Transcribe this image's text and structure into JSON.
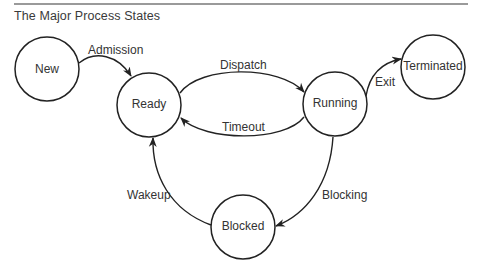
{
  "title": "The Major Process States",
  "colors": {
    "rule": "#9a9a9a",
    "stroke": "#222222",
    "text": "#333333"
  },
  "nodes": [
    {
      "id": "new",
      "label": "New",
      "cx": 47,
      "cy": 69,
      "r": 32
    },
    {
      "id": "ready",
      "label": "Ready",
      "cx": 149,
      "cy": 105,
      "r": 32
    },
    {
      "id": "running",
      "label": "Running",
      "cx": 335,
      "cy": 104,
      "r": 32
    },
    {
      "id": "terminated",
      "label": "Terminated",
      "cx": 433,
      "cy": 67,
      "r": 32
    },
    {
      "id": "blocked",
      "label": "Blocked",
      "cx": 243,
      "cy": 227,
      "r": 32
    }
  ],
  "edges": [
    {
      "id": "admission",
      "from": "New",
      "to": "Ready",
      "label": "Admission",
      "lx": 88,
      "ly": 54
    },
    {
      "id": "dispatch",
      "from": "Ready",
      "to": "Running",
      "label": "Dispatch",
      "lx": 220,
      "ly": 69
    },
    {
      "id": "timeout",
      "from": "Running",
      "to": "Ready",
      "label": "Timeout",
      "lx": 222,
      "ly": 132
    },
    {
      "id": "exit",
      "from": "Running",
      "to": "Terminated",
      "label": "Exit",
      "lx": 375,
      "ly": 87
    },
    {
      "id": "blocking",
      "from": "Running",
      "to": "Blocked",
      "label": "Blocking",
      "lx": 322,
      "ly": 197
    },
    {
      "id": "wakeup",
      "from": "Blocked",
      "to": "Ready",
      "label": "Wakeup",
      "lx": 127,
      "ly": 197
    }
  ]
}
